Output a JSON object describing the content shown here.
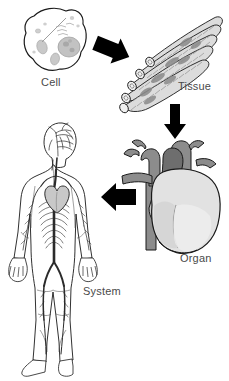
{
  "diagram": {
    "background_color": "#ffffff",
    "outline_color": "#1a1a1a",
    "label_color": "#4a4a4a"
  },
  "stages": [
    {
      "id": "cell",
      "label": "Cell",
      "order": 1,
      "description": "Irregular rounded cell with nucleus and organelles",
      "fill": "#ffffff",
      "organelle_fill": "#bdbdbd"
    },
    {
      "id": "tissue",
      "label": "Tissue",
      "order": 2,
      "description": "Bundle of striated muscle fibers",
      "fill": "#d8d8d8",
      "stripe_fill": "#9a9a9a"
    },
    {
      "id": "organ",
      "label": "Organ",
      "order": 3,
      "description": "Human heart with great vessels",
      "vessel_fill": "#8c8c8c",
      "vessel_dark_fill": "#6e6e6e",
      "chamber_fill": "#dcdcdc"
    },
    {
      "id": "system",
      "label": "System",
      "order": 4,
      "description": "Human body showing the circulatory system",
      "fill": "#ffffff",
      "vessel_fill": "#2b2b2b"
    }
  ],
  "arrows": [
    {
      "id": "cell-to-tissue",
      "from": "cell",
      "to": "tissue",
      "direction": "down-right",
      "color": "#000000"
    },
    {
      "id": "tissue-to-organ",
      "from": "tissue",
      "to": "organ",
      "direction": "down",
      "color": "#000000"
    },
    {
      "id": "organ-to-system",
      "from": "organ",
      "to": "system",
      "direction": "left",
      "color": "#000000"
    }
  ]
}
